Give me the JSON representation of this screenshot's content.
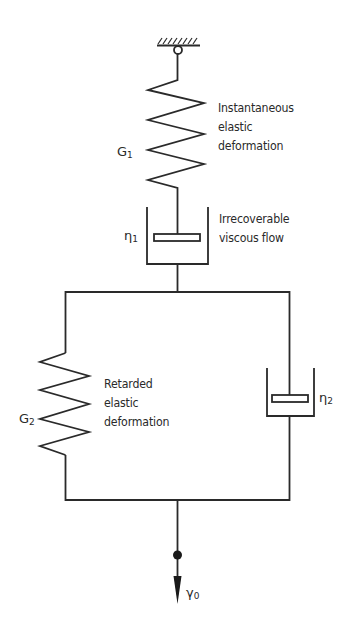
{
  "diagram": {
    "colors": {
      "line": "#2a2a2a",
      "background": "#ffffff"
    },
    "elements": {
      "fixed_support": {
        "icon": "hatched-wall-with-pin-icon"
      },
      "spring_1": {
        "symbol": "G",
        "subscript": "1",
        "description_lines": [
          "Instantaneous",
          "elastic",
          "deformation"
        ]
      },
      "dashpot_1": {
        "symbol": "η",
        "subscript": "1",
        "description_lines": [
          "Irrecoverable",
          "viscous flow"
        ]
      },
      "spring_2": {
        "symbol": "G",
        "subscript": "2",
        "description_lines": [
          "Retarded",
          "elastic",
          "deformation"
        ]
      },
      "dashpot_2": {
        "symbol": "η",
        "subscript": "2"
      },
      "load_point": {
        "symbol": "γ",
        "subscript": "0",
        "icon": "arrow-down-icon"
      }
    }
  }
}
